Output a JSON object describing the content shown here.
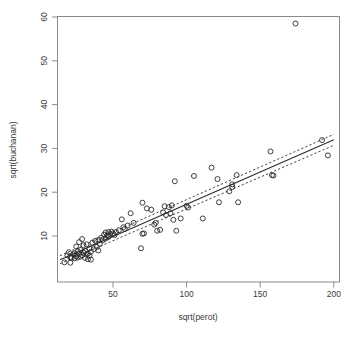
{
  "chart_data": {
    "type": "scatter",
    "title": "",
    "xlabel": "sqrt(perot)",
    "ylabel": "sqrt(buchanan)",
    "xlim": [
      12,
      206
    ],
    "ylim": [
      2.5,
      61
    ],
    "xticks": [
      50,
      100,
      150,
      200
    ],
    "yticks": [
      10,
      20,
      30,
      40,
      50,
      60
    ],
    "grid": false,
    "legend": null,
    "series": [
      {
        "name": "counties",
        "marker": "open-circle",
        "points": [
          [
            17,
            4.0
          ],
          [
            21,
            3.9
          ],
          [
            19,
            5.6
          ],
          [
            20,
            6.3
          ],
          [
            21,
            5.2
          ],
          [
            22,
            5.0
          ],
          [
            23,
            5.8
          ],
          [
            24,
            4.9
          ],
          [
            24,
            6.1
          ],
          [
            25,
            5.4
          ],
          [
            25,
            7.6
          ],
          [
            26,
            5.1
          ],
          [
            26,
            6.5
          ],
          [
            27,
            5.9
          ],
          [
            27,
            8.6
          ],
          [
            28,
            5.3
          ],
          [
            28,
            6.8
          ],
          [
            29,
            9.3
          ],
          [
            29,
            5.6
          ],
          [
            30,
            6.2
          ],
          [
            30,
            7.9
          ],
          [
            31,
            5.0
          ],
          [
            31,
            6.6
          ],
          [
            32,
            5.8
          ],
          [
            32,
            8.1
          ],
          [
            33,
            4.7
          ],
          [
            33,
            6.0
          ],
          [
            34,
            5.5
          ],
          [
            34,
            7.2
          ],
          [
            35,
            4.6
          ],
          [
            35,
            6.4
          ],
          [
            36,
            8.5
          ],
          [
            37,
            7.0
          ],
          [
            38,
            8.9
          ],
          [
            39,
            7.5
          ],
          [
            40,
            9.1
          ],
          [
            40,
            6.7
          ],
          [
            41,
            8.2
          ],
          [
            42,
            9.6
          ],
          [
            43,
            9.0
          ],
          [
            44,
            10.3
          ],
          [
            45,
            9.4
          ],
          [
            45,
            10.8
          ],
          [
            46,
            10.1
          ],
          [
            47,
            9.8
          ],
          [
            47,
            10.9
          ],
          [
            48,
            10.4
          ],
          [
            49,
            11.0
          ],
          [
            50,
            10.6
          ],
          [
            51,
            10.2
          ],
          [
            52,
            10.9
          ],
          [
            54,
            11.3
          ],
          [
            56,
            13.8
          ],
          [
            57,
            12.0
          ],
          [
            58,
            11.6
          ],
          [
            60,
            12.4
          ],
          [
            62,
            15.2
          ],
          [
            64,
            13.0
          ],
          [
            69,
            7.2
          ],
          [
            70,
            17.6
          ],
          [
            70,
            10.5
          ],
          [
            71,
            10.6
          ],
          [
            73,
            16.3
          ],
          [
            76,
            16.0
          ],
          [
            78,
            12.6
          ],
          [
            79,
            13.0
          ],
          [
            80,
            11.2
          ],
          [
            82,
            11.4
          ],
          [
            84,
            15.4
          ],
          [
            85,
            16.8
          ],
          [
            86,
            14.8
          ],
          [
            88,
            16.6
          ],
          [
            89,
            15.2
          ],
          [
            90,
            17.0
          ],
          [
            91,
            13.7
          ],
          [
            92,
            22.5
          ],
          [
            93,
            11.2
          ],
          [
            96,
            14.0
          ],
          [
            100,
            16.9
          ],
          [
            101,
            16.5
          ],
          [
            105,
            23.7
          ],
          [
            111,
            14.0
          ],
          [
            117,
            25.6
          ],
          [
            121,
            23.0
          ],
          [
            122,
            17.7
          ],
          [
            129,
            20.2
          ],
          [
            131,
            21.8
          ],
          [
            131,
            21.2
          ],
          [
            134,
            23.9
          ],
          [
            135,
            17.7
          ],
          [
            157,
            29.3
          ],
          [
            158,
            23.9
          ],
          [
            159,
            23.8
          ],
          [
            174,
            58.5
          ],
          [
            192,
            31.9
          ],
          [
            196,
            28.4
          ]
        ]
      }
    ],
    "fit_line": {
      "style": "solid",
      "x": [
        14,
        200
      ],
      "y": [
        4.6,
        32.0
      ]
    },
    "confidence_bands": [
      {
        "name": "upper",
        "style": "dashed",
        "x": [
          14,
          200
        ],
        "y": [
          5.5,
          33.2
        ]
      },
      {
        "name": "lower",
        "style": "dashed",
        "x": [
          14,
          200
        ],
        "y": [
          3.7,
          30.7
        ]
      }
    ]
  }
}
